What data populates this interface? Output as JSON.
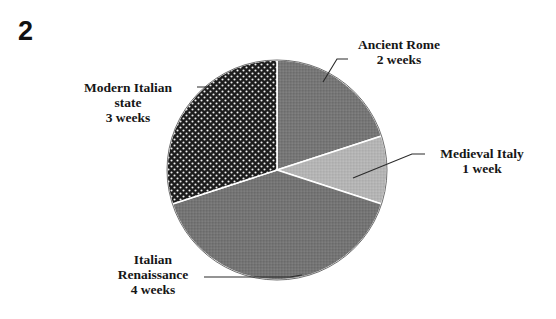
{
  "figure": {
    "number": "2"
  },
  "chart_data": {
    "type": "pie",
    "title": "",
    "unit": "weeks",
    "total": 10,
    "grid": false,
    "legend": "none",
    "label_style": "external-with-leader-lines",
    "start_angle_deg": 0,
    "direction": "clockwise",
    "categories": [
      "Ancient Rome",
      "Medieval Italy",
      "Italian Renaissance",
      "Modern Italian state"
    ],
    "values": [
      2,
      1,
      4,
      3
    ],
    "slices": [
      {
        "name": "Ancient Rome",
        "label_lines": [
          "Ancient Rome",
          "2 weeks"
        ],
        "value": 2,
        "value_text": "2 weeks",
        "percent": 20,
        "angle_deg": 72,
        "start_deg": 0,
        "end_deg": 72,
        "fill": "#767676",
        "pattern": "solid",
        "label_position": "upper-right"
      },
      {
        "name": "Medieval Italy",
        "label_lines": [
          "Medieval Italy",
          "1 week"
        ],
        "value": 1,
        "value_text": "1 week",
        "percent": 10,
        "angle_deg": 36,
        "start_deg": 72,
        "end_deg": 108,
        "fill": "#b4b4b4",
        "pattern": "solid",
        "label_position": "right"
      },
      {
        "name": "Italian Renaissance",
        "label_lines": [
          "Italian",
          "Renaissance",
          "4 weeks"
        ],
        "value": 4,
        "value_text": "4 weeks",
        "percent": 40,
        "angle_deg": 144,
        "start_deg": 108,
        "end_deg": 252,
        "fill": "#747474",
        "pattern": "solid",
        "label_position": "lower-left"
      },
      {
        "name": "Modern Italian state",
        "label_lines": [
          "Modern Italian",
          "state",
          "3 weeks"
        ],
        "value": 3,
        "value_text": "3 weeks",
        "percent": 30,
        "angle_deg": 108,
        "start_deg": 252,
        "end_deg": 360,
        "fill": "#1c1c1c",
        "pattern": "white-dots",
        "label_position": "upper-left"
      }
    ],
    "colors": {
      "ancient_rome": "#767676",
      "medieval_italy": "#b4b4b4",
      "italian_renaissance": "#747474",
      "modern_italian_state": "#1c1c1c",
      "slice_border": "#ffffff",
      "leader_line": "#2a2a2a",
      "background": "#ffffff",
      "text": "#161616"
    }
  }
}
